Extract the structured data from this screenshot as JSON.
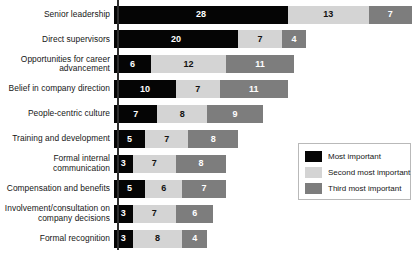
{
  "chart_data": {
    "type": "bar",
    "orientation": "horizontal",
    "stacked": true,
    "title": "",
    "subtitle": "",
    "xlabel": "",
    "ylabel": "",
    "grid": false,
    "axis_line": "vertical left axis only",
    "xlim": [
      0,
      48
    ],
    "legend_position": "right-middle",
    "categories": [
      "Senior leadership",
      "Direct supervisors",
      "Opportunities for career advancement",
      "Belief in company direction",
      "People-centric culture",
      "Training and development",
      "Formal internal communication",
      "Compensation and benefits",
      "Involvement/consultation on company decisions",
      "Formal recognition"
    ],
    "series": [
      {
        "name": "Most important",
        "color": "#050505",
        "values": [
          28,
          20,
          6,
          10,
          7,
          5,
          3,
          5,
          3,
          3
        ]
      },
      {
        "name": "Second most important",
        "color": "#d4d4d4",
        "values": [
          13,
          7,
          12,
          7,
          8,
          7,
          7,
          6,
          7,
          8
        ]
      },
      {
        "name": "Third most important",
        "color": "#7d7d7d",
        "values": [
          7,
          4,
          11,
          11,
          9,
          8,
          8,
          7,
          6,
          4
        ]
      }
    ],
    "totals": [
      48,
      31,
      29,
      28,
      24,
      20,
      18,
      18,
      16,
      15
    ]
  },
  "legend": {
    "items": [
      {
        "label": "Most important",
        "swatch": "s0"
      },
      {
        "label": "Second most important",
        "swatch": "s1"
      },
      {
        "label": "Third most important",
        "swatch": "s2"
      }
    ]
  }
}
